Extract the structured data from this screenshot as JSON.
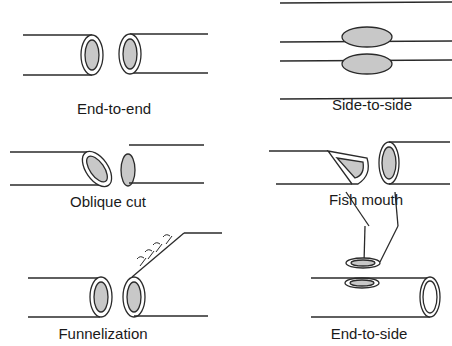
{
  "diagram": {
    "panels": [
      {
        "id": "end-to-end",
        "label": "End-to-end"
      },
      {
        "id": "side-to-side",
        "label": "Side-to-side"
      },
      {
        "id": "oblique-cut",
        "label": "Oblique cut"
      },
      {
        "id": "fish-mouth",
        "label": "Fish mouth"
      },
      {
        "id": "funnelization",
        "label": "Funnelization"
      },
      {
        "id": "end-to-side",
        "label": "End-to-side"
      }
    ],
    "colors": {
      "line": "#2a2a2a",
      "lumen_fill": "#c8c8c8",
      "background": "#ffffff"
    }
  }
}
